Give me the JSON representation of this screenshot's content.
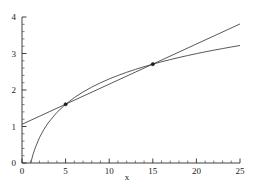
{
  "chart_data": {
    "type": "line",
    "title": "",
    "subtitle": "",
    "xlabel": "x",
    "ylabel": "",
    "xlim": [
      0,
      25
    ],
    "ylim": [
      0,
      4
    ],
    "grid": false,
    "legend": "none",
    "x_ticks": [
      0,
      5,
      10,
      15,
      20,
      25
    ],
    "x_tick_labels": [
      "0",
      "5",
      "10",
      "15",
      "20",
      "25"
    ],
    "x_minor_tick_step": 1,
    "y_ticks": [
      0,
      1,
      2,
      3,
      4
    ],
    "y_tick_labels": [
      "0",
      "1",
      "2",
      "3",
      "4"
    ],
    "y_minor_tick_step": 0.2,
    "series": [
      {
        "name": "logarithmic-curve",
        "type": "line",
        "color": "#3a3a3a",
        "x": [
          1.0,
          1.25,
          1.5,
          2.0,
          2.5,
          3.0,
          4.0,
          5.0,
          6.0,
          7.0,
          8.0,
          9.0,
          10.0,
          11.0,
          12.0,
          13.0,
          14.0,
          15.0,
          16.0,
          17.0,
          18.0,
          19.0,
          20.0,
          21.0,
          22.0,
          23.0,
          24.0,
          25.0
        ],
        "values": [
          0.0,
          0.223,
          0.405,
          0.693,
          0.916,
          1.099,
          1.386,
          1.609,
          1.792,
          1.946,
          2.079,
          2.197,
          2.303,
          2.398,
          2.485,
          2.565,
          2.639,
          2.708,
          2.773,
          2.833,
          2.89,
          2.944,
          2.996,
          3.045,
          3.091,
          3.135,
          3.178,
          3.219
        ]
      },
      {
        "name": "secant-line",
        "type": "line",
        "color": "#3a3a3a",
        "x": [
          0,
          25
        ],
        "values": [
          1.06,
          3.81
        ]
      }
    ],
    "markers": [
      {
        "name": "intersection-point-1",
        "x": 5,
        "y": 1.609
      },
      {
        "name": "intersection-point-2",
        "x": 15,
        "y": 2.708
      }
    ]
  }
}
